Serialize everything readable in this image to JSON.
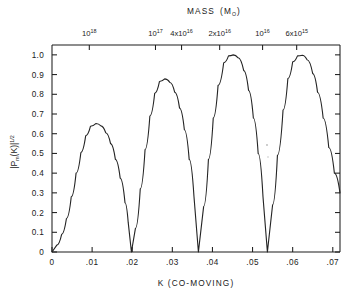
{
  "figure": {
    "background_color": "#ffffff",
    "line_color": "#242424",
    "axis_color": "#1d1d1d"
  },
  "top_axis": {
    "title_main": "MASS",
    "title_paren_open": "(M",
    "title_sub": "O",
    "title_paren_close": ")",
    "title_full": "MASS (M⊙)",
    "labels": [
      {
        "mantissa": "10",
        "exponent": "18",
        "text": "10^18",
        "k": 0.0093
      },
      {
        "mantissa": "10",
        "exponent": "17",
        "text": "10^17",
        "k": 0.0258
      },
      {
        "mantissa": "4x10",
        "exponent": "16",
        "text": "4x10^16",
        "k": 0.0323
      },
      {
        "mantissa": "2x10",
        "exponent": "16",
        "text": "2x10^16",
        "k": 0.0418
      },
      {
        "mantissa": "10",
        "exponent": "16",
        "text": "10^16",
        "k": 0.0525
      },
      {
        "mantissa": "6x10",
        "exponent": "15",
        "text": "6x10^15",
        "k": 0.061
      }
    ]
  },
  "y_axis": {
    "label_prefix": "|P",
    "label_sub": "m",
    "label_mid": "(K)|",
    "label_exponent": "1/2",
    "label_full": "|Pm(K)|^1/2",
    "ticks": [
      "0",
      "0.1",
      "0.2",
      "0.3",
      "0.4",
      "0.5",
      "0.6",
      "0.7",
      "0.8",
      "0.9",
      "1.0"
    ],
    "tick_values": [
      0,
      0.1,
      0.2,
      0.3,
      0.4,
      0.5,
      0.6,
      0.7,
      0.8,
      0.9,
      1.0
    ],
    "range": [
      0,
      1.05
    ]
  },
  "x_axis": {
    "title": "K (CO-MOVING)",
    "ticks": [
      "0",
      ".01",
      ".02",
      ".03",
      ".04",
      ".05",
      ".06",
      ".07"
    ],
    "tick_values": [
      0,
      0.01,
      0.02,
      0.03,
      0.04,
      0.05,
      0.06,
      0.07
    ],
    "range": [
      0,
      0.0718
    ]
  },
  "chart_data": {
    "type": "line",
    "xlabel": "K (CO-MOVING)",
    "ylabel": "|Pm(K)|^1/2",
    "xlim": [
      0,
      0.0718
    ],
    "ylim": [
      0,
      1.05
    ],
    "grid": false,
    "legend": "none",
    "zero_crossings": [
      0.0,
      0.0198,
      0.0365,
      0.0537
    ],
    "peaks": [
      {
        "k": 0.011,
        "value": 0.652
      },
      {
        "k": 0.0281,
        "value": 0.878
      },
      {
        "k": 0.0452,
        "value": 1.0
      },
      {
        "k": 0.0624,
        "value": 0.998
      }
    ],
    "series": [
      {
        "name": "|Pm(K)|^1/2",
        "x": [
          0.0,
          0.0012,
          0.0024,
          0.0036,
          0.0048,
          0.006,
          0.0072,
          0.0084,
          0.0096,
          0.011,
          0.0122,
          0.0134,
          0.0146,
          0.0158,
          0.017,
          0.0182,
          0.019,
          0.0198,
          0.0208,
          0.022,
          0.0232,
          0.0244,
          0.0256,
          0.0268,
          0.0281,
          0.0294,
          0.0306,
          0.0318,
          0.033,
          0.0342,
          0.0354,
          0.0365,
          0.0378,
          0.039,
          0.0402,
          0.0414,
          0.0428,
          0.044,
          0.0452,
          0.0464,
          0.0478,
          0.049,
          0.0502,
          0.0514,
          0.0526,
          0.0537,
          0.055,
          0.0562,
          0.0576,
          0.0588,
          0.06,
          0.0612,
          0.0624,
          0.0636,
          0.065,
          0.0662,
          0.0676,
          0.069,
          0.0704,
          0.0718
        ],
        "y": [
          0.0,
          0.035,
          0.09,
          0.17,
          0.28,
          0.4,
          0.505,
          0.59,
          0.638,
          0.652,
          0.64,
          0.605,
          0.55,
          0.47,
          0.375,
          0.25,
          0.15,
          0.0,
          0.12,
          0.32,
          0.52,
          0.69,
          0.805,
          0.865,
          0.878,
          0.86,
          0.81,
          0.73,
          0.62,
          0.47,
          0.28,
          0.0,
          0.23,
          0.47,
          0.68,
          0.845,
          0.96,
          0.995,
          1.0,
          0.985,
          0.92,
          0.82,
          0.68,
          0.5,
          0.28,
          0.0,
          0.24,
          0.49,
          0.72,
          0.88,
          0.965,
          0.995,
          0.998,
          0.975,
          0.905,
          0.81,
          0.68,
          0.53,
          0.4,
          0.3
        ]
      }
    ]
  }
}
